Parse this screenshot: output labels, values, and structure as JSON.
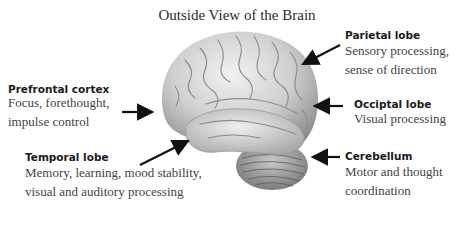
{
  "title": "Outside View of the Brain",
  "regions": [
    {
      "name": "Prefrontal cortex",
      "desc_lines": [
        "Focus, forethought,",
        "impulse control"
      ]
    },
    {
      "name": "Temporal lobe",
      "desc_lines": [
        "Memory, learning, mood stability,",
        "visual and auditory processing"
      ]
    },
    {
      "name": "Parietal lobe",
      "desc_lines": [
        "Sensory processing,",
        "sense of direction"
      ]
    },
    {
      "name": "Occiptal lobe",
      "desc_lines": [
        "Visual processing"
      ]
    },
    {
      "name": "Cerebellum",
      "desc_lines": [
        "Motor and thought",
        "coordination"
      ]
    }
  ],
  "colors": {
    "arrow": "#111111",
    "brain_light": "#e6e6e6",
    "brain_mid": "#b8b8b8",
    "brain_dark": "#7a7a7a"
  }
}
